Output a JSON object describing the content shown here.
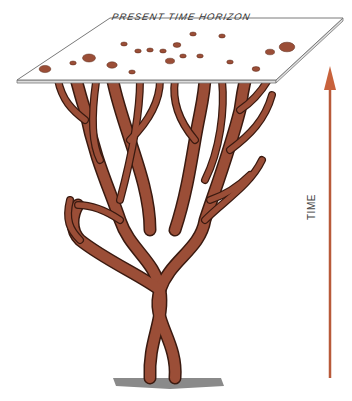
{
  "diagram": {
    "plane": {
      "label": "PRESENT TIME HORIZON",
      "fill": "#ffffff",
      "edge": "#7a7a7a"
    },
    "tree": {
      "fill": "#9b4e37",
      "outline": "#3a1a10",
      "ground_color": "#8a8a8a"
    },
    "axis": {
      "label": "TIME",
      "color": "#b85a3a",
      "direction": "up"
    },
    "dots": [
      {
        "x": 45,
        "y": 69,
        "r": 4.5
      },
      {
        "x": 73,
        "y": 63,
        "r": 2.5
      },
      {
        "x": 89,
        "y": 58,
        "r": 5
      },
      {
        "x": 112,
        "y": 65,
        "r": 4
      },
      {
        "x": 132,
        "y": 72,
        "r": 2.5
      },
      {
        "x": 124,
        "y": 44,
        "r": 2.5
      },
      {
        "x": 138,
        "y": 51,
        "r": 2.5
      },
      {
        "x": 150,
        "y": 50,
        "r": 2.5
      },
      {
        "x": 163,
        "y": 51,
        "r": 2.5
      },
      {
        "x": 177,
        "y": 45,
        "r": 3
      },
      {
        "x": 170,
        "y": 61,
        "r": 3.5
      },
      {
        "x": 183,
        "y": 56,
        "r": 2.5
      },
      {
        "x": 200,
        "y": 56,
        "r": 2.5
      },
      {
        "x": 193,
        "y": 34,
        "r": 2.5
      },
      {
        "x": 222,
        "y": 36,
        "r": 2.5
      },
      {
        "x": 230,
        "y": 62,
        "r": 2.5
      },
      {
        "x": 256,
        "y": 69,
        "r": 3
      },
      {
        "x": 270,
        "y": 52,
        "r": 3.5
      },
      {
        "x": 287,
        "y": 47,
        "r": 6
      }
    ]
  }
}
